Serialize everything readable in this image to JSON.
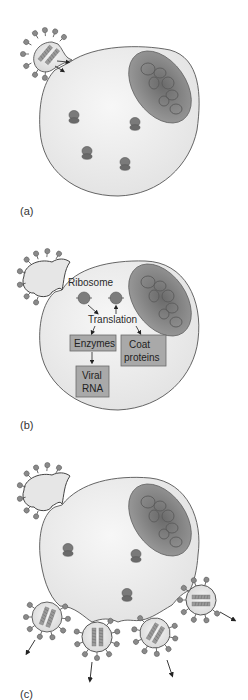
{
  "figure": {
    "colors": {
      "cell_fill": "#ededed",
      "cell_stroke": "#555555",
      "nucleus_fill": "#8c8c8c",
      "nucleus_dark": "#6e6e6e",
      "ribosome": "#7a7a7a",
      "box_fill": "#a9a9a9",
      "box_stroke": "#6a6a6a",
      "spike": "#8a8a8a"
    },
    "panels": [
      {
        "id": "a",
        "label": "(a)"
      },
      {
        "id": "b",
        "label": "(b)",
        "labels": {
          "ribosome": "Ribosome",
          "translation": "Translation"
        },
        "boxes": [
          {
            "id": "enzymes",
            "lines": [
              "Enzymes"
            ]
          },
          {
            "id": "coat_proteins",
            "lines": [
              "Coat",
              "proteins"
            ]
          },
          {
            "id": "viral_rna",
            "lines": [
              "Viral",
              "RNA"
            ]
          }
        ]
      },
      {
        "id": "c",
        "label": "(c)"
      }
    ]
  }
}
